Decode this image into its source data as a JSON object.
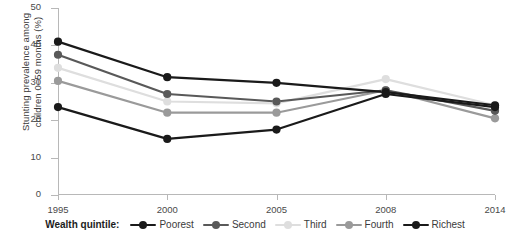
{
  "chart_data": {
    "type": "line",
    "title": "",
    "xlabel": "",
    "ylabel": "Stunting prevalence among\nchildren 0–59 months (%)",
    "x": [
      "1995",
      "2000",
      "2005",
      "2008",
      "2014"
    ],
    "categories": [
      "1995",
      "2000",
      "2005",
      "2008",
      "2014"
    ],
    "ylim": [
      0,
      50
    ],
    "yticks": [
      0,
      10,
      20,
      30,
      40,
      50
    ],
    "ytick_labels": [
      "0",
      "10",
      "20",
      "30",
      "40",
      "50"
    ],
    "grid": false,
    "legend_position": "bottom",
    "legend_title": "Wealth quintile:",
    "series": [
      {
        "name": "Poorest",
        "color": "#1a1a1a",
        "values": [
          41,
          31.5,
          30,
          27.5,
          24
        ]
      },
      {
        "name": "Second",
        "color": "#595959",
        "values": [
          37.5,
          27,
          25,
          28,
          22.5
        ]
      },
      {
        "name": "Third",
        "color": "#dedede",
        "values": [
          34,
          25,
          24.5,
          31,
          24
        ]
      },
      {
        "name": "Fourth",
        "color": "#9a9a9a",
        "values": [
          30.5,
          22,
          22,
          28,
          20.5
        ]
      },
      {
        "name": "Richest",
        "color": "#1a1a1a",
        "values": [
          23.5,
          15,
          17.5,
          27,
          23.5
        ]
      }
    ]
  },
  "axis": {
    "x_tick_labels": [
      "1995",
      "2000",
      "2005",
      "2008",
      "2014"
    ],
    "y_tick_labels": [
      "50",
      "40",
      "30",
      "20",
      "10",
      "0"
    ],
    "y_title": "Stunting prevalence among\nchildren 0–59 months (%)"
  },
  "legend": {
    "title": "Wealth quintile:",
    "items": [
      {
        "label": "Poorest",
        "color": "#1a1a1a"
      },
      {
        "label": "Second",
        "color": "#595959"
      },
      {
        "label": "Third",
        "color": "#dedede"
      },
      {
        "label": "Fourth",
        "color": "#9a9a9a"
      },
      {
        "label": "Richest",
        "color": "#1a1a1a"
      }
    ]
  },
  "colors": {
    "axis": "#b8b8b8",
    "text": "#3b3b3b",
    "background": "#ffffff"
  }
}
